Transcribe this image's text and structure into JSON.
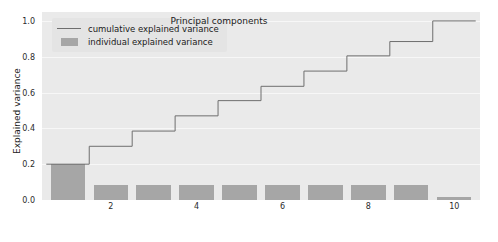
{
  "chart_data": {
    "type": "bar",
    "title": "",
    "xlabel": "Principal components",
    "ylabel": "Explained variance",
    "xlim": [
      0.4,
      10.6
    ],
    "ylim": [
      0.0,
      1.05
    ],
    "grid": true,
    "legend_position": "upper left",
    "categories": [
      1,
      2,
      3,
      4,
      5,
      6,
      7,
      8,
      9,
      10
    ],
    "xticks": [
      2,
      4,
      6,
      8,
      10
    ],
    "xtick_labels": [
      "2",
      "4",
      "6",
      "8",
      "10"
    ],
    "yticks": [
      0.0,
      0.2,
      0.4,
      0.6,
      0.8,
      1.0
    ],
    "ytick_labels": [
      "0.0",
      "0.2",
      "0.4",
      "0.6",
      "0.8",
      "1.0"
    ],
    "series": [
      {
        "name": "individual explained variance",
        "kind": "bar",
        "color": "#a6a6a6",
        "values": [
          0.2,
          0.085,
          0.085,
          0.085,
          0.085,
          0.085,
          0.085,
          0.085,
          0.085,
          0.015
        ]
      },
      {
        "name": "cumulative explained variance",
        "kind": "step",
        "color": "#6e6e6e",
        "values": [
          0.2,
          0.3,
          0.385,
          0.47,
          0.555,
          0.635,
          0.72,
          0.805,
          0.885,
          1.0
        ]
      }
    ]
  },
  "legend": {
    "items": [
      {
        "label": "cumulative explained variance",
        "key": "line"
      },
      {
        "label": "individual explained variance",
        "key": "patch"
      }
    ]
  },
  "colors": {
    "plot_background": "#eaeaea",
    "figure_background": "#ffffff",
    "gridline": "#f7f7f7",
    "bar": "#a6a6a6",
    "step_line": "#6e6e6e",
    "tick_text": "#2b2b2b",
    "axis_label": "#1a1a1a",
    "legend_background": "#e4e4e4"
  }
}
